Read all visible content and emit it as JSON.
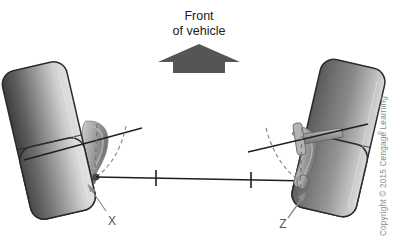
{
  "figure": {
    "title_line1": "Front",
    "title_line2": "of vehicle",
    "direction_arrow": "up-arrow-icon",
    "background_color": "#ffffff"
  },
  "labels": {
    "left_point": "X",
    "right_point": "Z"
  },
  "copyright": {
    "text": "Copyright © 2015 Cengage Learning",
    "registered_mark": "®"
  },
  "colors": {
    "tire_dark": "#4a4a4a",
    "tire_mid": "#6f6f6f",
    "tire_light": "#d2d2d2",
    "tire_outline": "#2b2b2b",
    "knuckle_light": "#c9c9c9",
    "knuckle_mid": "#9a9a9a",
    "knuckle_dark": "#6b6b6b",
    "arrow_fill": "#555555",
    "line_stroke": "#1e1e1e",
    "dashed_stroke": "#767676",
    "leader_stroke": "#888888",
    "text_color": "#202020",
    "copyright_color": "#8a8a8a"
  },
  "geometry": {
    "left_tire_rotation_deg": -13,
    "right_tire_rotation_deg": 13,
    "tie_rod": {
      "x1": 96,
      "y1": 177,
      "x2": 310,
      "y2": 181,
      "tick_count": 2
    },
    "left_steering_axis": {
      "x1": 24,
      "y1": 160,
      "x2": 142,
      "y2": 128
    },
    "right_steering_axis": {
      "x1": 248,
      "y1": 152,
      "x2": 368,
      "y2": 124
    }
  }
}
